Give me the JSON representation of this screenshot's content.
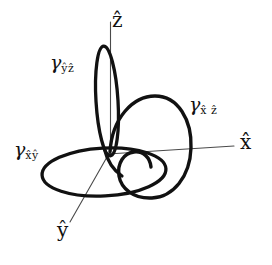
{
  "figure": {
    "type": "3d-axes-loop-diagram",
    "background_color": "#ffffff",
    "stroke_color": "#111111",
    "axis_stroke_color": "#444444",
    "loop_stroke_width": 3.2,
    "axis_stroke_width": 1.0
  },
  "axes": [
    {
      "id": "x-axis",
      "label": "x̂",
      "label_base": "x",
      "accent": "hat",
      "direction": "right",
      "label_x": 240,
      "label_y": 140
    },
    {
      "id": "y-axis",
      "label": "ŷ",
      "label_base": "y",
      "accent": "hat",
      "direction": "down-left",
      "label_x": 58,
      "label_y": 228
    },
    {
      "id": "z-axis",
      "label": "ẑ",
      "label_base": "z",
      "accent": "hat",
      "direction": "up",
      "label_x": 112,
      "label_y": 14
    }
  ],
  "loops": [
    {
      "id": "gamma-xy",
      "label_gamma": "γ",
      "subscript": "x̂ŷ",
      "sub_base_1": "x",
      "sub_base_2": "y",
      "plane": "xy",
      "label_x": 14,
      "label_y": 143,
      "shape": "horizontal-ellipse"
    },
    {
      "id": "gamma-yz",
      "label_gamma": "γ",
      "subscript": "ŷẑ",
      "sub_base_1": "y",
      "sub_base_2": "z",
      "plane": "yz",
      "label_x": 50,
      "label_y": 56,
      "shape": "narrow-vertical-ellipse"
    },
    {
      "id": "gamma-xz",
      "label_gamma": "γ",
      "subscript": "x̂ ẑ",
      "sub_base_1": "x",
      "sub_base_2": "z",
      "plane": "xz",
      "label_x": 189,
      "label_y": 98,
      "shape": "large-circle"
    }
  ],
  "origin": {
    "x": 110,
    "y": 152
  }
}
